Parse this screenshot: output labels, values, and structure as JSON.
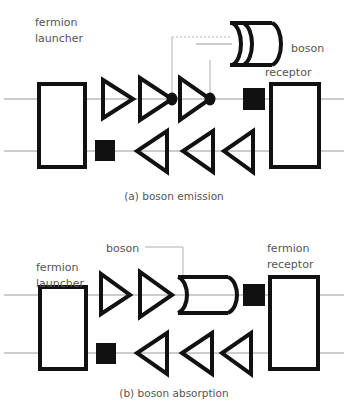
{
  "figure": {
    "background": "#ffffff",
    "ink_color": "#111111",
    "wire_color": "#9a9a9a",
    "text_color": "#555555",
    "width": 348,
    "height": 410
  },
  "panels": [
    {
      "id": "a",
      "caption": "(a) boson emission",
      "labels": {
        "launcher_line1": "fermion",
        "launcher_line2": "launcher",
        "boson": "boson",
        "receptor": "receptor"
      },
      "top_wire_label": "fermion top line",
      "bottom_wire_label": "fermion bottom line",
      "top_arrows": 3,
      "bottom_arrows": 3,
      "vertex_dots": 2,
      "squares": 2,
      "boson_orientation": "opens-left"
    },
    {
      "id": "b",
      "caption": "(b) boson absorption",
      "labels": {
        "launcher_line1": "fermion",
        "launcher_line2": "launcher",
        "boson": "boson",
        "receptor_line1": "fermion",
        "receptor_line2": "receptor"
      },
      "top_wire_label": "fermion top line",
      "bottom_wire_label": "fermion bottom line",
      "top_arrows": 2,
      "bottom_arrows": 3,
      "vertex_dots": 0,
      "squares": 2,
      "boson_orientation": "opens-left-inline"
    }
  ]
}
